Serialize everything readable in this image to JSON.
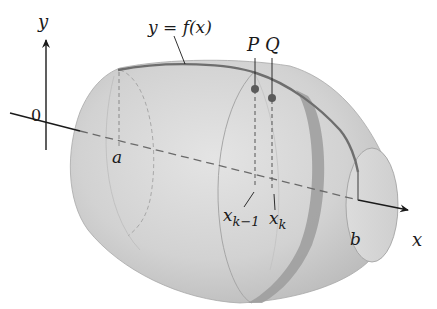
{
  "figure": {
    "labels": {
      "y_axis": "y",
      "x_axis": "x",
      "origin": "0",
      "curve": "y = f(x)",
      "point_p": "P",
      "point_q": "Q",
      "a": "a",
      "b": "b",
      "x_k_minus_1_base": "x",
      "x_k_minus_1_sub": "k−1",
      "x_k_base": "x",
      "x_k_sub": "k"
    },
    "colors": {
      "surface": "#d4d4d4",
      "surface_dark": "#b5b5b5",
      "band": "#9a9a9a",
      "curve": "#6e6e6e",
      "axis": "#1a1a1a",
      "points": "#5a5a5a"
    }
  }
}
